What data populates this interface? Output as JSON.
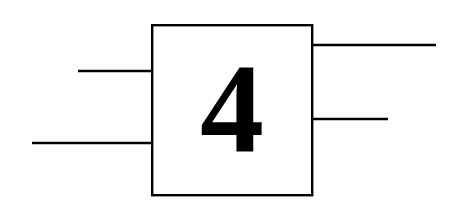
{
  "diagram": {
    "background_color": "#ffffff",
    "stroke_color": "#000000",
    "block": {
      "label": "4",
      "shape": "rectangle",
      "x": 151,
      "y": 24,
      "width": 162,
      "height": 172,
      "border_width": 2,
      "fill_color": "#ffffff",
      "border_color": "#000000"
    },
    "inputs": [
      {
        "name": "input-line-upper",
        "side": "left",
        "x1": 78,
        "y1": 71,
        "x2": 151,
        "y2": 71,
        "length": 73
      },
      {
        "name": "input-line-lower",
        "side": "left",
        "x1": 32,
        "y1": 143,
        "x2": 151,
        "y2": 143,
        "length": 119
      }
    ],
    "outputs": [
      {
        "name": "output-line-upper",
        "side": "right",
        "x1": 313,
        "y1": 45,
        "x2": 436,
        "y2": 45,
        "length": 123
      },
      {
        "name": "output-line-lower",
        "side": "right",
        "x1": 313,
        "y1": 119,
        "x2": 388,
        "y2": 119,
        "length": 75
      }
    ]
  }
}
